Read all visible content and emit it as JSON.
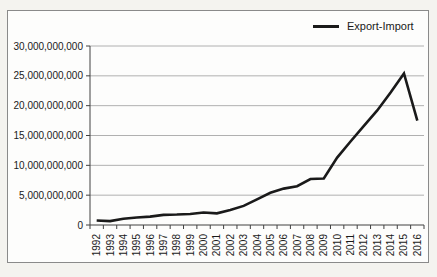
{
  "chart": {
    "legend": {
      "label": "Export-Import"
    },
    "colors": {
      "line": "#1a1a1a",
      "gridline": "#b0b0b0",
      "axis": "#404040",
      "text": "#1a1a1a",
      "chart_border": "#8a8a8a",
      "chart_bg": "#fdfdfc",
      "page_bg": "#f4f3ef"
    }
  },
  "chart_data": {
    "type": "line",
    "title": "",
    "xlabel": "",
    "ylabel": "",
    "grid": "horizontal",
    "legend_position": "top-right",
    "legend_entries": [
      "Export-Import"
    ],
    "categories": [
      "1992",
      "1993",
      "1994",
      "1995",
      "1996",
      "1997",
      "1998",
      "1999",
      "2000",
      "2001",
      "2002",
      "2003",
      "2004",
      "2005",
      "2006",
      "2007",
      "2008",
      "2009",
      "2010",
      "2011",
      "2012",
      "2013",
      "2014",
      "2015",
      "2016"
    ],
    "series": [
      {
        "name": "Export-Import",
        "values": [
          750000000,
          650000000,
          1050000000,
          1250000000,
          1400000000,
          1700000000,
          1750000000,
          1850000000,
          2100000000,
          1950000000,
          2500000000,
          3200000000,
          4300000000,
          5400000000,
          6100000000,
          6500000000,
          7700000000,
          7800000000,
          11300000000,
          14000000000,
          16600000000,
          19200000000,
          22200000000,
          25400000000,
          17500000000
        ]
      }
    ],
    "ylim": [
      0,
      30000000000
    ],
    "ytick_step": 5000000000,
    "ytick_labels": [
      "0",
      "5,000,000,000",
      "10,000,000,000",
      "15,000,000,000",
      "20,000,000,000",
      "25,000,000,000",
      "30,000,000,000"
    ]
  }
}
